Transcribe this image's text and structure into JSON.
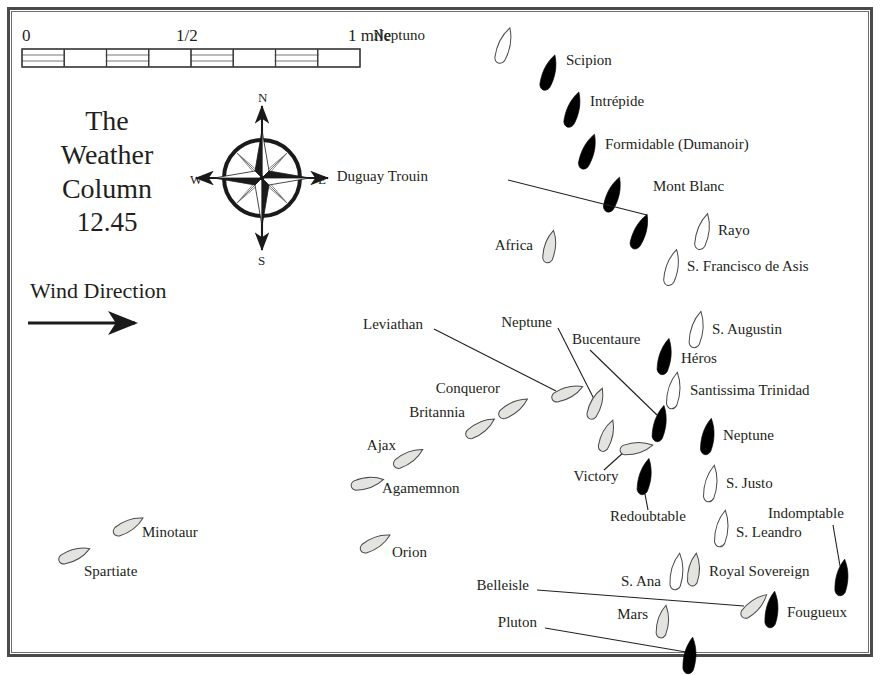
{
  "title_block": {
    "line1": "The",
    "line2": "Weather",
    "line3": "Column",
    "time": "12.45"
  },
  "wind": {
    "label": "Wind Direction",
    "arrow_icon": "arrow-right-icon"
  },
  "scale_bar": {
    "start": "0",
    "middle": "1/2",
    "end": "1 mile",
    "segments": 8
  },
  "compass": {
    "north": "N",
    "south": "S",
    "east": "E",
    "west": "W",
    "icon": "compass-rose-icon"
  },
  "colors": {
    "frame": "#4a4a4a",
    "ink": "#231f20",
    "british_fill": "#e3e3e0",
    "french_fill": "#000000",
    "spanish_fill": "#ffffff"
  },
  "chart_data": {
    "type": "map",
    "ships": [
      {
        "name": "Neptuno",
        "fleet": "spanish",
        "x": 504,
        "y": 46,
        "angle": 18,
        "label_x": 425,
        "label_y": 37,
        "label_anchor": "end"
      },
      {
        "name": "Scipion",
        "fleet": "french",
        "x": 549,
        "y": 73,
        "angle": 18,
        "label_x": 566,
        "label_y": 62,
        "label_anchor": "start"
      },
      {
        "name": "Intrépide",
        "fleet": "french",
        "x": 573,
        "y": 110,
        "angle": 18,
        "label_x": 590,
        "label_y": 103,
        "label_anchor": "start"
      },
      {
        "name": "Formidable (Dumanoir)",
        "fleet": "french",
        "x": 588,
        "y": 152,
        "angle": 20,
        "label_x": 605,
        "label_y": 146,
        "label_anchor": "start"
      },
      {
        "name": "Mont Blanc",
        "fleet": "french",
        "x": 613,
        "y": 195,
        "angle": 20,
        "label_x": 653,
        "label_y": 188,
        "label_anchor": "start"
      },
      {
        "name": "Duguay Trouin",
        "fleet": "french",
        "x": 640,
        "y": 232,
        "angle": 22,
        "label_x": 428,
        "label_y": 178,
        "label_anchor": "end",
        "leader": true,
        "lead_x1": 508,
        "lead_y1": 180,
        "lead_x2": 647,
        "lead_y2": 215
      },
      {
        "name": "Africa",
        "fleet": "british",
        "x": 550,
        "y": 247,
        "angle": 12,
        "label_x": 533,
        "label_y": 247,
        "label_anchor": "end"
      },
      {
        "name": "Rayo",
        "fleet": "spanish",
        "x": 703,
        "y": 232,
        "angle": 14,
        "label_x": 718,
        "label_y": 232,
        "label_anchor": "start"
      },
      {
        "name": "S. Francisco de Asis",
        "fleet": "spanish",
        "x": 672,
        "y": 268,
        "angle": 14,
        "label_x": 687,
        "label_y": 268,
        "label_anchor": "start"
      },
      {
        "name": "S. Augustin",
        "fleet": "spanish",
        "x": 697,
        "y": 330,
        "angle": 12,
        "label_x": 712,
        "label_y": 331,
        "label_anchor": "start"
      },
      {
        "name": "Héros",
        "fleet": "french",
        "x": 665,
        "y": 357,
        "angle": 12,
        "label_x": 681,
        "label_y": 360,
        "label_anchor": "start"
      },
      {
        "name": "Santissima Trinidad",
        "fleet": "spanish",
        "x": 674,
        "y": 391,
        "angle": 10,
        "label_x": 690,
        "label_y": 392,
        "label_anchor": "start"
      },
      {
        "name": "Bucentaure",
        "fleet": "french",
        "x": 660,
        "y": 424,
        "angle": 12,
        "label_x": 572,
        "label_y": 341,
        "label_anchor": "start",
        "leader": true,
        "lead_x1": 590,
        "lead_y1": 350,
        "lead_x2": 657,
        "lead_y2": 415
      },
      {
        "name": "Neptune",
        "fleet": "french",
        "x": 708,
        "y": 437,
        "angle": 10,
        "label_x": 723,
        "label_y": 437,
        "label_anchor": "start"
      },
      {
        "name": "Redoubtable",
        "fleet": "french",
        "x": 645,
        "y": 477,
        "angle": 12,
        "label_x": 648,
        "label_y": 518,
        "label_anchor": "middle",
        "leader": true,
        "lead_x1": 645,
        "lead_y1": 494,
        "lead_x2": 648,
        "lead_y2": 510
      },
      {
        "name": "S. Justo",
        "fleet": "spanish",
        "x": 711,
        "y": 484,
        "angle": 10,
        "label_x": 726,
        "label_y": 485,
        "label_anchor": "start"
      },
      {
        "name": "S. Leandro",
        "fleet": "spanish",
        "x": 722,
        "y": 529,
        "angle": 10,
        "label_x": 736,
        "label_y": 534,
        "label_anchor": "start"
      },
      {
        "name": "Indomptable",
        "fleet": "french",
        "x": 842,
        "y": 578,
        "angle": 8,
        "label_x": 768,
        "label_y": 515,
        "label_anchor": "start",
        "leader": true,
        "lead_x1": 833,
        "lead_y1": 525,
        "lead_x2": 840,
        "lead_y2": 566
      },
      {
        "name": "Leviathan",
        "fleet": "british",
        "x": 567,
        "y": 393,
        "angle": 68,
        "label_x": 423,
        "label_y": 326,
        "label_anchor": "end",
        "leader": true,
        "lead_x1": 434,
        "lead_y1": 329,
        "lead_x2": 556,
        "lead_y2": 391
      },
      {
        "name": "Neptune",
        "fleet": "british",
        "x": 596,
        "y": 404,
        "angle": 22,
        "label_x": 552,
        "label_y": 324,
        "label_anchor": "end",
        "leader": true,
        "lead_x1": 558,
        "lead_y1": 328,
        "lead_x2": 594,
        "lead_y2": 399
      },
      {
        "name": "Conqueror",
        "fleet": "british",
        "x": 513,
        "y": 408,
        "angle": 58,
        "label_x": 500,
        "label_y": 390,
        "label_anchor": "end"
      },
      {
        "name": "Britannia",
        "fleet": "british",
        "x": 480,
        "y": 428,
        "angle": 58,
        "label_x": 465,
        "label_y": 414,
        "label_anchor": "end"
      },
      {
        "name": "Ajax",
        "fleet": "british",
        "x": 408,
        "y": 458,
        "angle": 60,
        "label_x": 396,
        "label_y": 447,
        "label_anchor": "end"
      },
      {
        "name": "Agamemnon",
        "fleet": "british",
        "x": 367,
        "y": 483,
        "angle": 78,
        "label_x": 382,
        "label_y": 490,
        "label_anchor": "start"
      },
      {
        "name": "Victory",
        "fleet": "british",
        "x": 636,
        "y": 448,
        "angle": 80,
        "label_x": 596,
        "label_y": 478,
        "label_anchor": "middle",
        "leader": true,
        "lead_x1": 624,
        "lead_y1": 452,
        "lead_x2": 604,
        "lead_y2": 470
      },
      {
        "name": "Victory-extra",
        "fleet": "british",
        "x": 607,
        "y": 436,
        "angle": 20,
        "label_x": 0,
        "label_y": 0,
        "label_anchor": "none",
        "hide_label": true
      },
      {
        "name": "Minotaur",
        "fleet": "british",
        "x": 128,
        "y": 526,
        "angle": 62,
        "label_x": 142,
        "label_y": 534,
        "label_anchor": "start"
      },
      {
        "name": "Spartiate",
        "fleet": "british",
        "x": 74,
        "y": 555,
        "angle": 68,
        "label_x": 84,
        "label_y": 573,
        "label_anchor": "start"
      },
      {
        "name": "Orion",
        "fleet": "british",
        "x": 375,
        "y": 543,
        "angle": 62,
        "label_x": 392,
        "label_y": 554,
        "label_anchor": "start"
      },
      {
        "name": "S. Ana",
        "fleet": "spanish",
        "x": 677,
        "y": 572,
        "angle": 8,
        "label_x": 661,
        "label_y": 583,
        "label_anchor": "end"
      },
      {
        "name": "Royal Sovereign",
        "fleet": "british",
        "x": 694,
        "y": 570,
        "angle": 8,
        "label_x": 709,
        "label_y": 573,
        "label_anchor": "start"
      },
      {
        "name": "Belleisle",
        "fleet": "british",
        "x": 754,
        "y": 606,
        "angle": 48,
        "label_x": 529,
        "label_y": 587,
        "label_anchor": "end",
        "leader": true,
        "lead_x1": 537,
        "lead_y1": 590,
        "lead_x2": 744,
        "lead_y2": 606
      },
      {
        "name": "Fougueux",
        "fleet": "french",
        "x": 772,
        "y": 610,
        "angle": 8,
        "label_x": 787,
        "label_y": 614,
        "label_anchor": "start"
      },
      {
        "name": "Mars",
        "fleet": "british",
        "x": 663,
        "y": 622,
        "angle": 10,
        "label_x": 648,
        "label_y": 616,
        "label_anchor": "end"
      },
      {
        "name": "Pluton",
        "fleet": "french",
        "x": 690,
        "y": 656,
        "angle": 8,
        "label_x": 537,
        "label_y": 624,
        "label_anchor": "end",
        "leader": true,
        "lead_x1": 545,
        "lead_y1": 628,
        "lead_x2": 686,
        "lead_y2": 652
      }
    ],
    "fleets": {
      "british": "Royal Navy (light)",
      "french": "French (solid black)",
      "spanish": "Spanish (white outline)"
    }
  }
}
